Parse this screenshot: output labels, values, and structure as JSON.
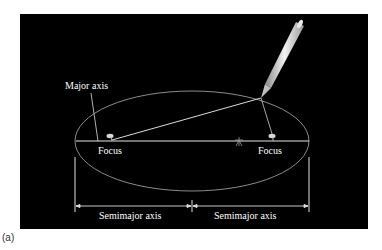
{
  "figure": {
    "caption": "(a)",
    "background": "#000000",
    "line_color": "#ffffff",
    "ellipse_color": "#9a9a9a"
  },
  "labels": {
    "major_axis": "Major axis",
    "focus_left": "Focus",
    "focus_right": "Focus",
    "semimajor_left": "Semimajor axis",
    "semimajor_right": "Semimajor axis"
  },
  "icons": {
    "pencil": "pencil-icon",
    "pin": "pin-icon",
    "center_star": "star-icon"
  }
}
